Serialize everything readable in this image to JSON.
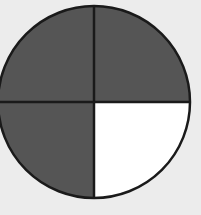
{
  "diagram": {
    "type": "fraction-circle",
    "total_parts": 4,
    "shaded_parts": 3,
    "fraction": "3/4",
    "parts": [
      {
        "position": "top-left",
        "shaded": true
      },
      {
        "position": "top-right",
        "shaded": true
      },
      {
        "position": "bottom-left",
        "shaded": true
      },
      {
        "position": "bottom-right",
        "shaded": false
      }
    ],
    "colors": {
      "background": "#ececec",
      "shaded": "#555555",
      "unshaded": "#ffffff",
      "stroke": "#1a1a1a"
    }
  }
}
